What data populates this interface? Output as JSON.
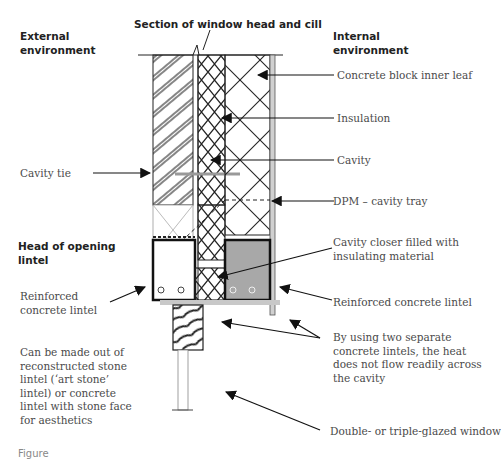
{
  "title": "Section of window head and cill",
  "headings": {
    "external": "External environment",
    "internal": "Internal environment",
    "head_of_opening": "Head of opening lintel"
  },
  "labels": {
    "concrete_block_inner_leaf": "Concrete block inner leaf",
    "insulation": "Insulation",
    "cavity": "Cavity",
    "dpm_cavity_tray": "DPM – cavity tray",
    "cavity_closer": "Cavity closer filled with insulating material",
    "reinforced_concrete_lintel_right": "Reinforced concrete lintel",
    "two_lintels_note": "By using two separate concrete lintels, the heat does not flow readily across the cavity",
    "glazed_window": "Double- or triple-glazed window",
    "cavity_tie": "Cavity tie",
    "reinforced_concrete_lintel_left": "Reinforced concrete lintel",
    "stone_lintel_note": "Can be made out of reconstructed stone lintel (‘art stone’ lintel) or concrete lintel with stone face for aesthetics"
  },
  "caption": "Figure",
  "colors": {
    "line": "#1a1a1a",
    "text": "#4a4a4a",
    "lintel_fill_internal": "#a8a8a8",
    "plaster": "#d0d0d0"
  }
}
